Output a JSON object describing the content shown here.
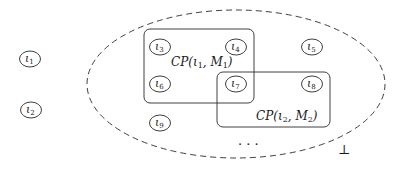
{
  "diagram": {
    "colors": {
      "stroke": "#2a2a2a",
      "background": "#ffffff"
    },
    "ellipse": {
      "cx": 236,
      "cy": 84,
      "rx": 149,
      "ry": 74,
      "style": "dashed"
    },
    "nodes": [
      {
        "id": "iota1",
        "symbol": "ι",
        "sub": "1",
        "x": 30,
        "y": 59
      },
      {
        "id": "iota2",
        "symbol": "ι",
        "sub": "2",
        "x": 31,
        "y": 110
      },
      {
        "id": "iota3",
        "symbol": "ι",
        "sub": "3",
        "x": 160,
        "y": 47
      },
      {
        "id": "iota4",
        "symbol": "ι",
        "sub": "4",
        "x": 236,
        "y": 47
      },
      {
        "id": "iota5",
        "symbol": "ι",
        "sub": "5",
        "x": 312,
        "y": 47
      },
      {
        "id": "iota6",
        "symbol": "ι",
        "sub": "6",
        "x": 160,
        "y": 84
      },
      {
        "id": "iota7",
        "symbol": "ι",
        "sub": "7",
        "x": 236,
        "y": 84
      },
      {
        "id": "iota8",
        "symbol": "ι",
        "sub": "8",
        "x": 312,
        "y": 84
      },
      {
        "id": "iota9",
        "symbol": "ι",
        "sub": "9",
        "x": 160,
        "y": 123
      }
    ],
    "boxes": [
      {
        "id": "cp1",
        "x": 144,
        "y": 29,
        "w": 110,
        "h": 74,
        "label": {
          "pre": "CP(ι",
          "sub1": "1",
          "mid": ", M",
          "sub2": "1",
          "post": ")",
          "x": 171,
          "y": 66
        }
      },
      {
        "id": "cp2",
        "x": 217,
        "y": 72,
        "w": 113,
        "h": 55,
        "label": {
          "pre": "CP(ι",
          "sub1": "2",
          "mid": ", M",
          "sub2": "2",
          "post": ")",
          "x": 256,
          "y": 120
        }
      }
    ],
    "ellipsis": {
      "text": "· · ·",
      "x": 250,
      "y": 149
    },
    "bottom": {
      "text": "⊥",
      "x": 343,
      "y": 154
    }
  }
}
